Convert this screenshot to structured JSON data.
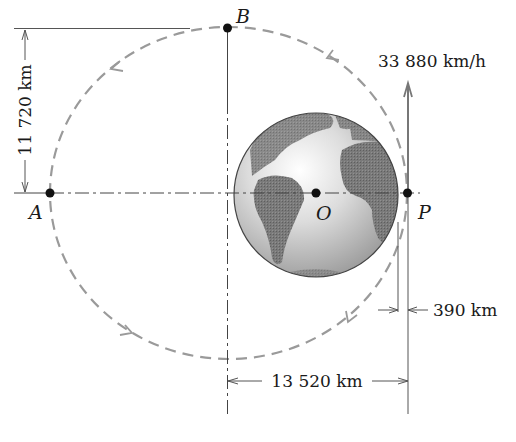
{
  "figure": {
    "points": {
      "A": "A",
      "B": "B",
      "O": "O",
      "P": "P"
    },
    "velocity_label": "33 880 km/h",
    "dimensions": {
      "vertical": "11 720 km",
      "horizontal": "13 520 km",
      "altitude": "390 km"
    },
    "body": "earth-globe",
    "orbit": "elliptical-dashed",
    "orbit_direction": "counterclockwise",
    "colors": {
      "orbit": "#9a9a9a",
      "lines": "#555555",
      "points": "#111111",
      "earth_land": "#6e6e6e",
      "earth_ocean": "#cfcfcf"
    }
  }
}
